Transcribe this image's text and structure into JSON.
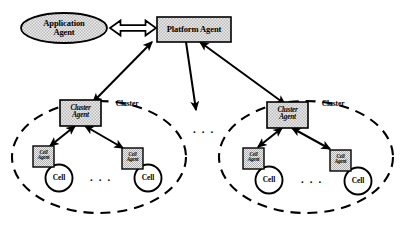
{
  "diagram": {
    "colors": {
      "stroke": "#000000",
      "background": "#ffffff",
      "node_fill_pattern": "#d8d8d8",
      "node_fill_base": "#e8e8e8",
      "cell_fill": "#ffffff"
    },
    "nodes": {
      "application_agent": {
        "label_line1": "Application",
        "label_line2": "Agent",
        "shape": "ellipse"
      },
      "platform_agent": {
        "label": "Platform Agent",
        "shape": "rectangle"
      },
      "cluster_agent_left": {
        "label_line1": "Cluster",
        "label_line2": "Agent",
        "shape": "rectangle"
      },
      "cluster_agent_right": {
        "label_line1": "Cluster",
        "label_line2": "Agent",
        "shape": "rectangle"
      },
      "cell_agent_left_1": {
        "label_line1": "Cell",
        "label_line2": "Agent",
        "shape": "rectangle"
      },
      "cell_agent_left_2": {
        "label_line1": "Cell",
        "label_line2": "Agent",
        "shape": "rectangle"
      },
      "cell_agent_right_1": {
        "label_line1": "Cell",
        "label_line2": "Agent",
        "shape": "rectangle"
      },
      "cell_agent_right_2": {
        "label_line1": "Cell",
        "label_line2": "Agent",
        "shape": "rectangle"
      },
      "cell_left_1": {
        "label": "Cell",
        "shape": "circle"
      },
      "cell_left_2": {
        "label": "Cell",
        "shape": "circle"
      },
      "cell_right_1": {
        "label": "Cell",
        "shape": "circle"
      },
      "cell_right_2": {
        "label": "Cell",
        "shape": "circle"
      }
    },
    "groups": {
      "cluster_left": {
        "label": "Cluster",
        "shape": "dashed-ellipse"
      },
      "cluster_right": {
        "label": "Cluster",
        "shape": "dashed-ellipse"
      }
    },
    "ellipses_text": {
      "between_clusters": ". . .",
      "left_cluster_cells": ". . .",
      "right_cluster_cells": ". . ."
    },
    "connectors": [
      {
        "name": "application-to-platform",
        "from": "application_agent",
        "to": "platform_agent",
        "style": "hollow-block-double-arrow"
      },
      {
        "name": "platform-to-cluster-left",
        "from": "platform_agent",
        "to": "cluster_agent_left",
        "style": "solid-double-arrow"
      },
      {
        "name": "platform-to-middle",
        "from": "platform_agent",
        "to": "between-clusters",
        "style": "solid-arrow"
      },
      {
        "name": "platform-to-cluster-right",
        "from": "platform_agent",
        "to": "cluster_agent_right",
        "style": "solid-double-arrow"
      },
      {
        "name": "cluster-left-to-cell-agent-1",
        "from": "cluster_agent_left",
        "to": "cell_agent_left_1",
        "style": "solid-double-arrow"
      },
      {
        "name": "cluster-left-to-cell-agent-2",
        "from": "cluster_agent_left",
        "to": "cell_agent_left_2",
        "style": "solid-double-arrow"
      },
      {
        "name": "cluster-right-to-cell-agent-1",
        "from": "cluster_agent_right",
        "to": "cell_agent_right_1",
        "style": "solid-double-arrow"
      },
      {
        "name": "cluster-right-to-cell-agent-2",
        "from": "cluster_agent_right",
        "to": "cell_agent_right_2",
        "style": "solid-double-arrow"
      }
    ]
  }
}
